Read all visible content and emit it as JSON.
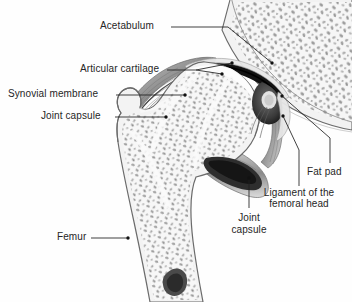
{
  "figure": {
    "type": "anatomical-illustration",
    "background_color": "#fefefe",
    "line_color": "#262626",
    "bone_fill": "#f4f4f4",
    "trabecular_color": "#9a9a9a",
    "cartilage_color": "#ffffff",
    "joint_space_color": "#111111"
  },
  "labels": {
    "acetabulum": "Acetabulum",
    "articular_cartilage": "Articular cartilage",
    "synovial_membrane": "Synovial membrane",
    "joint_capsule_left": "Joint capsule",
    "fat_pad": "Fat pad",
    "ligament_line1": "Ligament of the",
    "ligament_line2": "femoral head",
    "joint_capsule_lower_line1": "Joint",
    "joint_capsule_lower_line2": "capsule",
    "femur": "Femur"
  },
  "structures": [
    {
      "name": "pelvis-ilium",
      "region": "upper-right"
    },
    {
      "name": "acetabulum",
      "region": "superior-socket"
    },
    {
      "name": "femoral-head",
      "region": "center"
    },
    {
      "name": "greater-trochanter",
      "region": "left"
    },
    {
      "name": "femoral-neck",
      "region": "center-left"
    },
    {
      "name": "femoral-shaft",
      "region": "lower"
    },
    {
      "name": "joint-capsule",
      "region": "surrounding"
    },
    {
      "name": "articular-cartilage",
      "region": "joint-surface"
    },
    {
      "name": "synovial-membrane",
      "region": "capsule-inner"
    },
    {
      "name": "fat-pad",
      "region": "acetabular-fossa"
    },
    {
      "name": "ligament-of-femoral-head",
      "region": "fovea"
    }
  ]
}
